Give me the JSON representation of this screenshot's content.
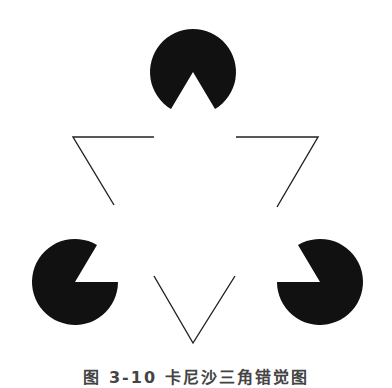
{
  "figure": {
    "colors": {
      "fill": "#111111",
      "stroke": "#222222",
      "background": "#ffffff"
    },
    "pacmen": [
      {
        "name": "top",
        "cx": 193,
        "cy": 72,
        "r": 43,
        "mouth": "down"
      },
      {
        "name": "left",
        "cx": 75,
        "cy": 282,
        "r": 43,
        "mouth": "upper-right"
      },
      {
        "name": "right",
        "cx": 320,
        "cy": 282,
        "r": 43,
        "mouth": "upper-left"
      }
    ],
    "outline_corners": [
      {
        "name": "top-left-corner",
        "points": "154,137 73,137 114,205"
      },
      {
        "name": "top-right-corner",
        "points": "236,137 318,137 277,207"
      },
      {
        "name": "bottom-corner",
        "points": "154,276 193,343 235,276"
      }
    ]
  },
  "caption": {
    "text": "图 3-10  卡尼沙三角错觉图"
  }
}
